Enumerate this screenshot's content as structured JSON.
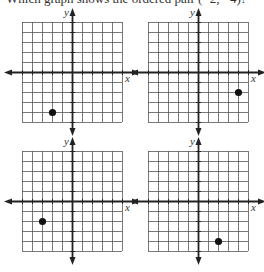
{
  "question": {
    "text": "Which graph shows the ordered pair (−2, −4)?"
  },
  "grid": {
    "columns": 10,
    "rows": 10,
    "cell_px": 10,
    "x_range": [
      -5,
      5
    ],
    "y_range": [
      -5,
      5
    ],
    "line_color": "#555555",
    "axis_color": "#222222",
    "point_color": "#111111"
  },
  "graphs": [
    {
      "id": "A",
      "x_axis_label": "x",
      "y_axis_label": "y",
      "point": {
        "x": -2,
        "y": -4
      }
    },
    {
      "id": "B",
      "x_axis_label": "x",
      "y_axis_label": "y",
      "point": {
        "x": 4,
        "y": -2
      }
    },
    {
      "id": "C",
      "x_axis_label": "x",
      "y_axis_label": "y",
      "point": {
        "x": -3,
        "y": -2
      }
    },
    {
      "id": "D",
      "x_axis_label": "x",
      "y_axis_label": "y",
      "point": {
        "x": 2,
        "y": -4
      }
    }
  ]
}
